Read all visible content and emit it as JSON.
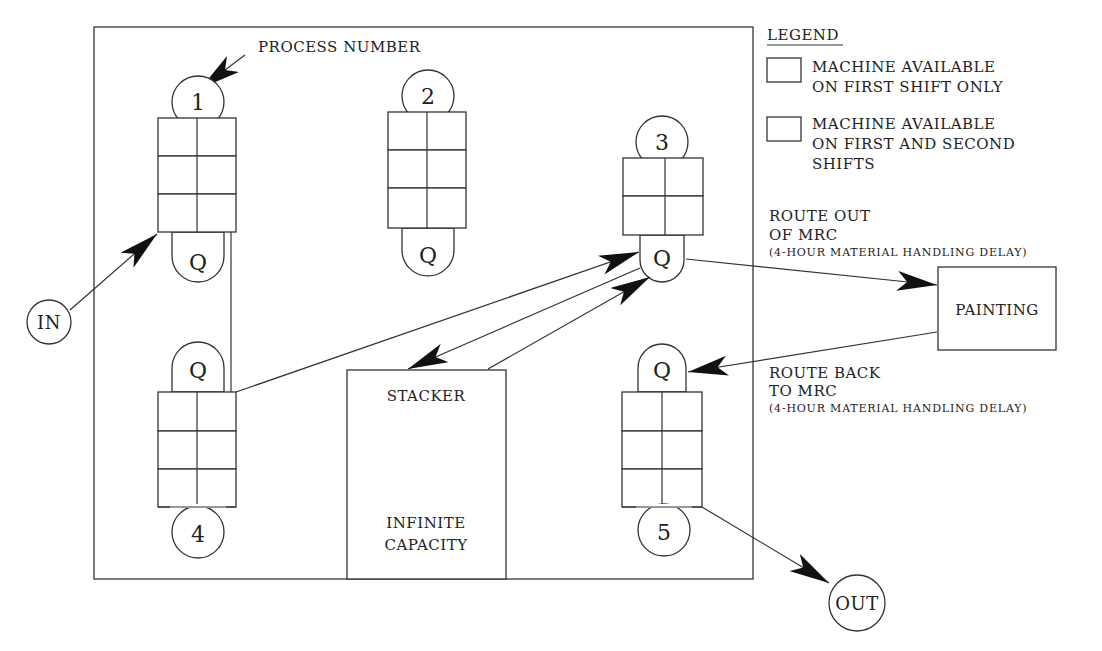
{
  "diagram": {
    "process_number_label": "PROCESS NUMBER",
    "legend": {
      "title": "LEGEND",
      "items": [
        {
          "pattern": "backslash-hatch",
          "line1": "MACHINE AVAILABLE",
          "line2": "ON FIRST SHIFT ONLY",
          "line3": ""
        },
        {
          "pattern": "slash-hatch",
          "line1": "MACHINE AVAILABLE",
          "line2": "ON FIRST AND SECOND",
          "line3": "SHIFTS"
        }
      ]
    },
    "processes": [
      {
        "number": "1",
        "queue": "Q",
        "rows": [
          "slash",
          "slash",
          "backslash"
        ]
      },
      {
        "number": "2",
        "queue": "Q",
        "rows": [
          "slash",
          "slash",
          "backslash"
        ]
      },
      {
        "number": "3",
        "queue": "Q",
        "rows": [
          "slash",
          "backslash"
        ]
      },
      {
        "number": "4",
        "queue": "Q",
        "rows": [
          "backslash",
          "slash",
          "slash"
        ]
      },
      {
        "number": "5",
        "queue": "Q",
        "rows": [
          "backslash",
          "slash",
          "slash"
        ]
      }
    ],
    "nodes": {
      "in": "IN",
      "out": "OUT",
      "painting": "PAINTING",
      "stacker_title": "STACKER",
      "stacker_line1": "INFINITE",
      "stacker_line2": "CAPACITY"
    },
    "routes": {
      "out_line1": "ROUTE OUT",
      "out_line2": "OF MRC",
      "out_note": "(4-HOUR MATERIAL HANDLING DELAY)",
      "back_line1": "ROUTE BACK",
      "back_line2": "TO MRC",
      "back_note": "(4-HOUR MATERIAL HANDLING DELAY)"
    }
  }
}
